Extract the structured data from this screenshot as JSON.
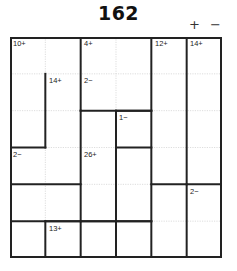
{
  "puzzle": {
    "title": "162",
    "type": "calcudoku",
    "size": 6,
    "operations_legend": "+ −",
    "operations": [
      "+",
      "−"
    ],
    "grid": {
      "rows": 6,
      "cols": 6,
      "cell_width": 35.33,
      "cell_height": 36.83,
      "border_color": "#222222",
      "inner_line_color": "#cccccc",
      "background": "#ffffff"
    },
    "cages": [
      {
        "id": "cage-10-plus",
        "clue": "10+",
        "anchor": {
          "row": 0,
          "col": 0
        },
        "cells": [
          [
            0,
            0
          ],
          [
            0,
            1
          ],
          [
            1,
            0
          ]
        ]
      },
      {
        "id": "cage-4-plus",
        "clue": "4+",
        "anchor": {
          "row": 0,
          "col": 2
        },
        "cells": [
          [
            0,
            2
          ],
          [
            0,
            3
          ],
          [
            1,
            3
          ]
        ]
      },
      {
        "id": "cage-12-plus",
        "clue": "12+",
        "anchor": {
          "row": 0,
          "col": 4
        },
        "cells": [
          [
            0,
            4
          ],
          [
            1,
            4
          ],
          [
            2,
            4
          ],
          [
            3,
            4
          ]
        ]
      },
      {
        "id": "cage-14-plus-right",
        "clue": "14+",
        "anchor": {
          "row": 0,
          "col": 5
        },
        "cells": [
          [
            0,
            5
          ],
          [
            1,
            5
          ],
          [
            2,
            5
          ],
          [
            3,
            5
          ]
        ]
      },
      {
        "id": "cage-14-plus-mid",
        "clue": "14+",
        "anchor": {
          "row": 1,
          "col": 1
        },
        "cells": [
          [
            1,
            1
          ],
          [
            1,
            2
          ],
          [
            2,
            1
          ],
          [
            2,
            0
          ]
        ]
      },
      {
        "id": "cage-2-minus-top",
        "clue": "2−",
        "anchor": {
          "row": 1,
          "col": 2
        },
        "cells": [
          [
            1,
            2
          ],
          [
            2,
            2
          ]
        ]
      },
      {
        "id": "cage-1-minus",
        "clue": "1−",
        "anchor": {
          "row": 2,
          "col": 3
        },
        "cells": [
          [
            2,
            3
          ],
          [
            3,
            3
          ],
          [
            4,
            3
          ]
        ]
      },
      {
        "id": "cage-2-minus-left",
        "clue": "2−",
        "anchor": {
          "row": 3,
          "col": 0
        },
        "cells": [
          [
            3,
            0
          ],
          [
            3,
            1
          ],
          [
            4,
            0
          ]
        ]
      },
      {
        "id": "cage-26-plus",
        "clue": "26+",
        "anchor": {
          "row": 3,
          "col": 2
        },
        "cells": [
          [
            3,
            2
          ],
          [
            4,
            2
          ]
        ]
      },
      {
        "id": "cage-2-minus-right",
        "clue": "2−",
        "anchor": {
          "row": 4,
          "col": 5
        },
        "cells": [
          [
            4,
            5
          ],
          [
            5,
            5
          ]
        ]
      },
      {
        "id": "cage-13-plus",
        "clue": "13+",
        "anchor": {
          "row": 5,
          "col": 1
        },
        "cells": [
          [
            5,
            1
          ],
          [
            5,
            2
          ],
          [
            5,
            3
          ]
        ]
      }
    ],
    "clue_labels": [
      {
        "text": "10+",
        "left": 3,
        "top": 3
      },
      {
        "text": "4+",
        "left": 74,
        "top": 3
      },
      {
        "text": "12+",
        "left": 145,
        "top": 3
      },
      {
        "text": "14+",
        "left": 180,
        "top": 3
      },
      {
        "text": "14+",
        "left": 39,
        "top": 40
      },
      {
        "text": "2−",
        "left": 74,
        "top": 40
      },
      {
        "text": "1−",
        "left": 109,
        "top": 77
      },
      {
        "text": "2−",
        "left": 3,
        "top": 114
      },
      {
        "text": "26+",
        "left": 74,
        "top": 114
      },
      {
        "text": "2−",
        "left": 180,
        "top": 151
      },
      {
        "text": "13+",
        "left": 39,
        "top": 188
      }
    ]
  }
}
